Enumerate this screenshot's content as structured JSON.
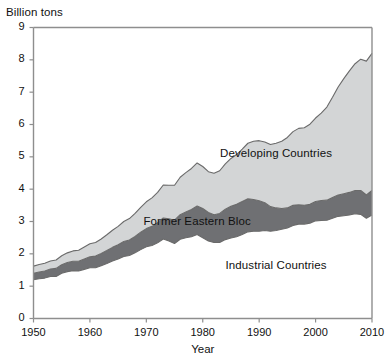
{
  "chart_data": {
    "type": "area",
    "stacked": true,
    "title": "",
    "subtitle": "",
    "xlabel": "Year",
    "ylabel": "Billion tons",
    "xlim": [
      1950,
      2010
    ],
    "ylim": [
      0,
      9
    ],
    "grid": false,
    "legend_position": "inline-labels",
    "x_ticks": [
      "1950",
      "1960",
      "1970",
      "1980",
      "1990",
      "2000",
      "2010"
    ],
    "x_tick_values": [
      1950,
      1960,
      1970,
      1980,
      1990,
      2000,
      2010
    ],
    "y_ticks": [
      "0",
      "1",
      "2",
      "3",
      "4",
      "5",
      "6",
      "7",
      "8",
      "9"
    ],
    "y_tick_values": [
      0,
      1,
      2,
      3,
      4,
      5,
      6,
      7,
      8,
      9
    ],
    "x": [
      1950,
      1951,
      1952,
      1953,
      1954,
      1955,
      1956,
      1957,
      1958,
      1959,
      1960,
      1961,
      1962,
      1963,
      1964,
      1965,
      1966,
      1967,
      1968,
      1969,
      1970,
      1971,
      1972,
      1973,
      1974,
      1975,
      1976,
      1977,
      1978,
      1979,
      1980,
      1981,
      1982,
      1983,
      1984,
      1985,
      1986,
      1987,
      1988,
      1989,
      1990,
      1991,
      1992,
      1993,
      1994,
      1995,
      1996,
      1997,
      1998,
      1999,
      2000,
      2001,
      2002,
      2003,
      2004,
      2005,
      2006,
      2007,
      2008,
      2009,
      2010
    ],
    "series": [
      {
        "name": "Industrial Countries",
        "color": "#ffffff",
        "outline": "#6a6a6a",
        "stack_order": 1,
        "label_position_year": 1993,
        "label_position_value": 1.6,
        "values": [
          1.2,
          1.23,
          1.25,
          1.3,
          1.3,
          1.4,
          1.45,
          1.48,
          1.47,
          1.52,
          1.57,
          1.57,
          1.63,
          1.7,
          1.78,
          1.84,
          1.92,
          1.95,
          2.03,
          2.13,
          2.22,
          2.26,
          2.34,
          2.46,
          2.4,
          2.32,
          2.45,
          2.5,
          2.53,
          2.6,
          2.5,
          2.4,
          2.35,
          2.35,
          2.44,
          2.49,
          2.53,
          2.6,
          2.68,
          2.7,
          2.7,
          2.72,
          2.7,
          2.72,
          2.76,
          2.8,
          2.88,
          2.92,
          2.92,
          2.95,
          3.02,
          3.03,
          3.04,
          3.1,
          3.16,
          3.18,
          3.2,
          3.24,
          3.22,
          3.1,
          3.2
        ]
      },
      {
        "name": "Former Eastern Bloc",
        "color": "#6f7073",
        "outline": "#4a4a4c",
        "stack_order": 2,
        "label_position_year": 1979,
        "label_position_value": 2.95,
        "values": [
          0.2,
          0.21,
          0.22,
          0.23,
          0.25,
          0.26,
          0.28,
          0.29,
          0.3,
          0.32,
          0.34,
          0.36,
          0.38,
          0.4,
          0.42,
          0.44,
          0.46,
          0.48,
          0.51,
          0.54,
          0.56,
          0.59,
          0.62,
          0.65,
          0.68,
          0.72,
          0.76,
          0.79,
          0.84,
          0.88,
          0.9,
          0.88,
          0.86,
          0.9,
          0.94,
          0.98,
          1.0,
          1.02,
          1.02,
          0.98,
          0.94,
          0.86,
          0.76,
          0.7,
          0.64,
          0.62,
          0.62,
          0.6,
          0.58,
          0.58,
          0.6,
          0.62,
          0.62,
          0.64,
          0.66,
          0.68,
          0.7,
          0.72,
          0.74,
          0.72,
          0.76
        ]
      },
      {
        "name": "Developing Countries",
        "color": "#d3d5d6",
        "outline": "#6a6a6a",
        "stack_order": 3,
        "label_position_year": 1993,
        "label_position_value": 5.05,
        "values": [
          0.22,
          0.23,
          0.24,
          0.25,
          0.26,
          0.28,
          0.3,
          0.32,
          0.34,
          0.37,
          0.4,
          0.42,
          0.45,
          0.49,
          0.53,
          0.57,
          0.62,
          0.66,
          0.71,
          0.77,
          0.83,
          0.88,
          0.94,
          1.02,
          1.04,
          1.08,
          1.16,
          1.22,
          1.27,
          1.33,
          1.3,
          1.26,
          1.28,
          1.32,
          1.4,
          1.48,
          1.54,
          1.62,
          1.72,
          1.8,
          1.86,
          1.88,
          1.92,
          2.0,
          2.08,
          2.18,
          2.28,
          2.36,
          2.4,
          2.48,
          2.58,
          2.7,
          2.88,
          3.1,
          3.34,
          3.56,
          3.76,
          3.92,
          4.06,
          4.14,
          4.24
        ]
      }
    ],
    "totals_note": "Stacked totals rise from about 1.6 billion tons in 1950 to about 8.2 billion tons in 2010"
  },
  "axes": {
    "y_title": "Billion tons",
    "x_title": "Year"
  },
  "labels": {
    "developing": "Developing Countries",
    "eastern_bloc": "Former Eastern Bloc",
    "industrial": "Industrial Countries"
  },
  "colors": {
    "developing_fill": "#d3d5d6",
    "eastern_bloc_fill": "#6f7073",
    "industrial_fill": "#ffffff",
    "outline": "#6a6a6a",
    "axis": "#8e8e8e",
    "text": "#111111",
    "background": "#ffffff"
  }
}
